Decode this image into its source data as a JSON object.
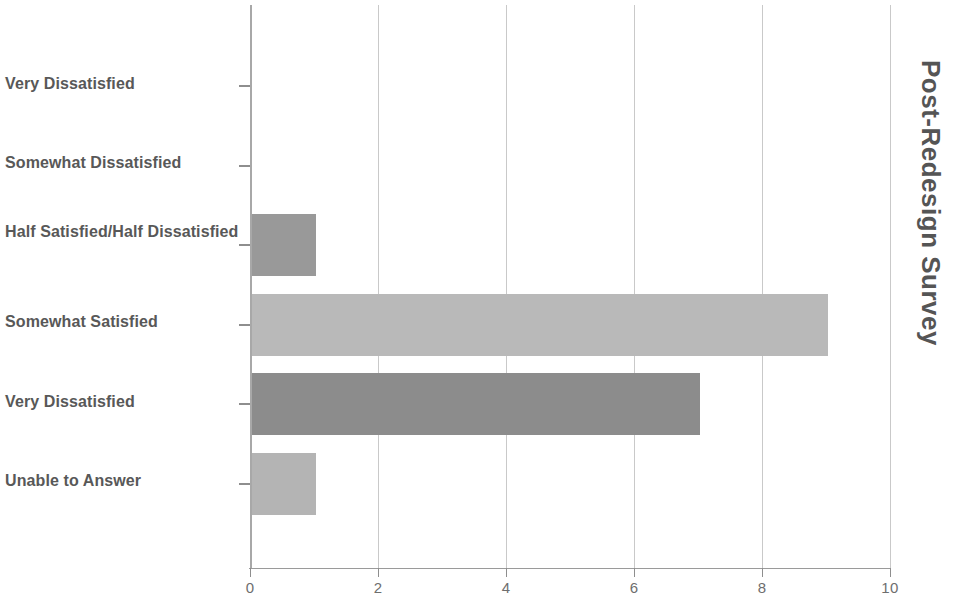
{
  "chart_data": {
    "type": "bar",
    "orientation": "horizontal",
    "title": "Post-Redesign Survey",
    "title_position": "right-rotated",
    "xlabel": "",
    "ylabel": "",
    "categories": [
      "Very Dissatisfied",
      "Somewhat Dissatisfied",
      "Half Satisfied/Half Dissatisfied",
      "Somewhat Satisfied",
      "Very Dissatisfied",
      "Unable to Answer"
    ],
    "values": [
      0,
      0,
      1,
      9,
      7,
      1
    ],
    "bar_colors": [
      "#999999",
      "#999999",
      "#999999",
      "#b9b9b9",
      "#8c8c8c",
      "#b4b4b4"
    ],
    "xlim": [
      0,
      10
    ],
    "xticks": [
      0,
      2,
      4,
      6,
      8,
      10
    ],
    "xtick_labels": [
      "0",
      "2",
      "4",
      "6",
      "8",
      "10"
    ],
    "grid": "vertical",
    "legend": "none"
  },
  "axis": {
    "gridline_color": "#c9c9c9",
    "axis_color": "#9a9a9a",
    "tick_color": "#8e8e8e"
  },
  "labels": {
    "category_text_color": "#585858",
    "tick_text_color": "#6e6e6e",
    "title_color": "#555555"
  }
}
